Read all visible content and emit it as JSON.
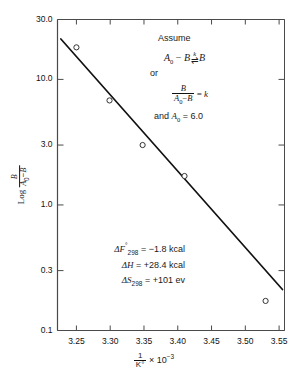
{
  "chart_data": {
    "type": "scatter",
    "title": "",
    "xlabel": "1/K° × 10⁻³",
    "ylabel": "Log B/(A₀ − B)",
    "xlim": [
      3.222,
      3.558
    ],
    "ylim": [
      0.1,
      30.0
    ],
    "yscale": "log",
    "xscale": "linear",
    "grid": false,
    "legend": "none",
    "xticks": [
      "3.25",
      "3.30",
      "3.35",
      "3.40",
      "3.45",
      "3.50",
      "3.55"
    ],
    "xtick_values": [
      3.25,
      3.3,
      3.35,
      3.4,
      3.45,
      3.5,
      3.55
    ],
    "yticks": [
      "30.0",
      "10.0",
      "3.0",
      "1.0",
      "0.3",
      "0.1"
    ],
    "ytick_values": [
      30.0,
      10.0,
      3.0,
      1.0,
      0.3,
      0.1
    ],
    "marker": "open-circle",
    "points": [
      {
        "x": 3.25,
        "y": 18.0
      },
      {
        "x": 3.299,
        "y": 6.8
      },
      {
        "x": 3.348,
        "y": 3.0
      },
      {
        "x": 3.41,
        "y": 1.7
      },
      {
        "x": 3.53,
        "y": 0.172
      }
    ],
    "fit_line": {
      "style": "solid",
      "x_start": 3.227,
      "y_start": 21.0,
      "x_end": 3.555,
      "y_end": 0.212
    }
  },
  "annotations": {
    "assume": {
      "heading": "Assume",
      "equation_1": {
        "lhs_a": "A",
        "lhs_a_sub": "0",
        "minus": "−",
        "lhs_b": "B",
        "rate_constant": "k",
        "arrows": "⇌",
        "rhs": "B"
      },
      "or": "or",
      "equation_2": {
        "numerator": "B",
        "denominator_a": "A",
        "denominator_a_sub": "0",
        "denominator_minus": "−",
        "denominator_b": "B",
        "equals": "=",
        "result": "k"
      },
      "and_line": {
        "prefix": "and",
        "symbol": "A",
        "symbol_sub": "0",
        "equals": "=",
        "value": "6.0"
      }
    },
    "thermo": [
      {
        "symbol": "ΔF",
        "superscript": "°",
        "subscript": "298",
        "equals": "=",
        "value": "−1.8 kcal"
      },
      {
        "symbol": "ΔH",
        "superscript": "",
        "subscript": "",
        "equals": "=",
        "value": "+28.4 kcal"
      },
      {
        "symbol": "ΔS",
        "superscript": "",
        "subscript": "298",
        "equals": "=",
        "value": "+101 ev"
      }
    ]
  },
  "axis_titles": {
    "y_prefix": "Log",
    "y_frac_num": "B",
    "y_frac_den_a": "A",
    "y_frac_den_sub": "0",
    "y_frac_den_minus": "−",
    "y_frac_den_b": "B",
    "x_frac_num": "1",
    "x_frac_den": "K°",
    "x_times": "× 10",
    "x_exp": "−3"
  },
  "colors": {
    "axis": "#4a4a4a",
    "line": "#111111",
    "text": "#1a1a1a",
    "marker_stroke": "#333333"
  }
}
